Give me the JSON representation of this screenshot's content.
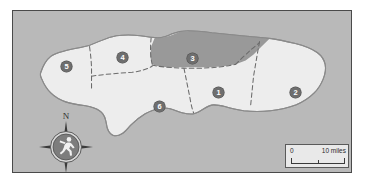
{
  "figure": {
    "kind": "choropleth-region-map",
    "background_color": "#ffffff",
    "panel_color": "#b9b9b9",
    "panel_border_color": "#4a4a4a"
  },
  "map": {
    "land_color": "#ededed",
    "land_outline_color": "#8a8a8a",
    "highlight_color": "#999999",
    "internal_border_color": "#6b6b6b",
    "internal_border_style": "dashed",
    "regions": [
      {
        "id": "region-1",
        "label": "1",
        "highlighted": false,
        "x": 206,
        "y": 82
      },
      {
        "id": "region-2",
        "label": "2",
        "highlighted": false,
        "x": 283,
        "y": 82
      },
      {
        "id": "region-3",
        "label": "3",
        "highlighted": true,
        "x": 180,
        "y": 48
      },
      {
        "id": "region-4",
        "label": "4",
        "highlighted": false,
        "x": 110,
        "y": 47
      },
      {
        "id": "region-5",
        "label": "5",
        "highlighted": false,
        "x": 54,
        "y": 56
      },
      {
        "id": "region-6",
        "label": "6",
        "highlighted": false,
        "x": 147,
        "y": 96
      }
    ]
  },
  "compass": {
    "north_label": "N",
    "icon": "running-figure-icon",
    "dial_color": "#7d7d7d",
    "dial_ring_color": "#5a5a5a",
    "figure_color": "#f2f2f2",
    "points": [
      "N",
      "E",
      "S",
      "W"
    ]
  },
  "scale_bar": {
    "min_label": "0",
    "max_label": "10 miles",
    "units": "miles",
    "max_value": 10,
    "background_color": "#e9e9e9",
    "border_color": "#5a5a5a"
  }
}
